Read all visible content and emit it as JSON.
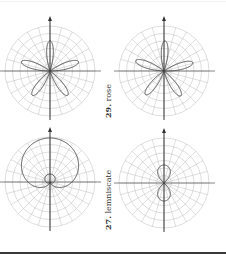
{
  "figure": {
    "plots": [
      {
        "id": "rose-3-petal",
        "center": [
          50,
          71
        ],
        "radius": 45,
        "curve": "rose",
        "petals": 5,
        "orientation": "one petal up"
      },
      {
        "id": "rose-8-like",
        "center": [
          166,
          71
        ],
        "radius": 45,
        "curve": "rose",
        "petals": 5,
        "orientation": "rotated"
      },
      {
        "id": "cardioid-like",
        "center": [
          50,
          182
        ],
        "radius": 45,
        "curve": "cardioid with inner loop",
        "orientation": "up"
      },
      {
        "id": "lemniscate",
        "center": [
          166,
          183
        ],
        "radius": 45,
        "curve": "lemniscate",
        "orientation": "vertical"
      }
    ],
    "labels": [
      {
        "number": "29.",
        "text": " rose"
      },
      {
        "number": "27.",
        "text": " lemniscate"
      }
    ],
    "colors": {
      "grid": "#bdbdbd",
      "axis": "#333333",
      "curve": "#444444",
      "rule": "#3a3a3a"
    }
  }
}
